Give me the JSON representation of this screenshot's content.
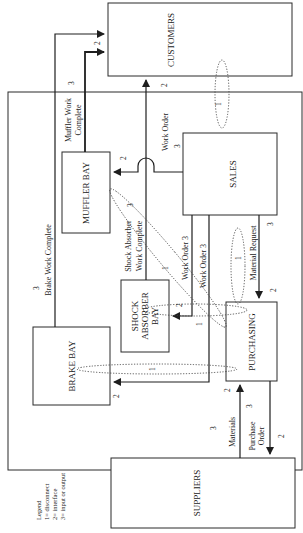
{
  "diagram": {
    "orientation": "rotated-90-ccw",
    "entities": {
      "customers": "CUSTOMERS",
      "muffler_bay": "MUFFLER BAY",
      "sales": "SALES",
      "shock_absorber_bay_1": "SHOCK",
      "shock_absorber_bay_2": "ABSORBER",
      "shock_absorber_bay_3": "BAY",
      "brake_bay": "BRAKE BAY",
      "purchasing": "PURCHASING",
      "suppliers": "SUPPLIERS"
    },
    "flows": {
      "muffler_work_complete_1": "Muffler Work",
      "muffler_work_complete_2": "Complete",
      "muffler_work_complete_type": "3",
      "customers_in_type": "2",
      "work_order_to_customers_type": "2",
      "work_order_sales": "Work Order",
      "work_order_sales_type": "3",
      "muffler_in_type": "2",
      "shock_work_complete_1": "Shock Absorber",
      "shock_work_complete_2": "Work Complete",
      "shock_work_complete_type": "3",
      "brake_work_complete": "Brake Work Complete",
      "brake_work_complete_type": "3",
      "work_order_shock": "Work Order 3",
      "work_order_brake": "Work Order 3",
      "shock_in_type": "2",
      "brake_in_type": "2",
      "material_request": "Material Request",
      "material_request_type": "3",
      "purchasing_in_type": "2",
      "purchasing_in_materials_type": "2",
      "materials": "Materials",
      "materials_type": "3",
      "purchase_order_1": "Purchase",
      "purchase_order_2": "Order",
      "purchase_order_type": "3",
      "suppliers_in_type": "2"
    },
    "disconnects": {
      "customers_sales": "1",
      "sales_purchasing": "1",
      "muffler_purchasing": "1",
      "shock_purchasing": "1",
      "brake_purchasing": "1"
    },
    "legend": {
      "title": "Legend",
      "items": [
        "1= disconnect",
        "2= interface",
        "3= input or output"
      ]
    }
  }
}
